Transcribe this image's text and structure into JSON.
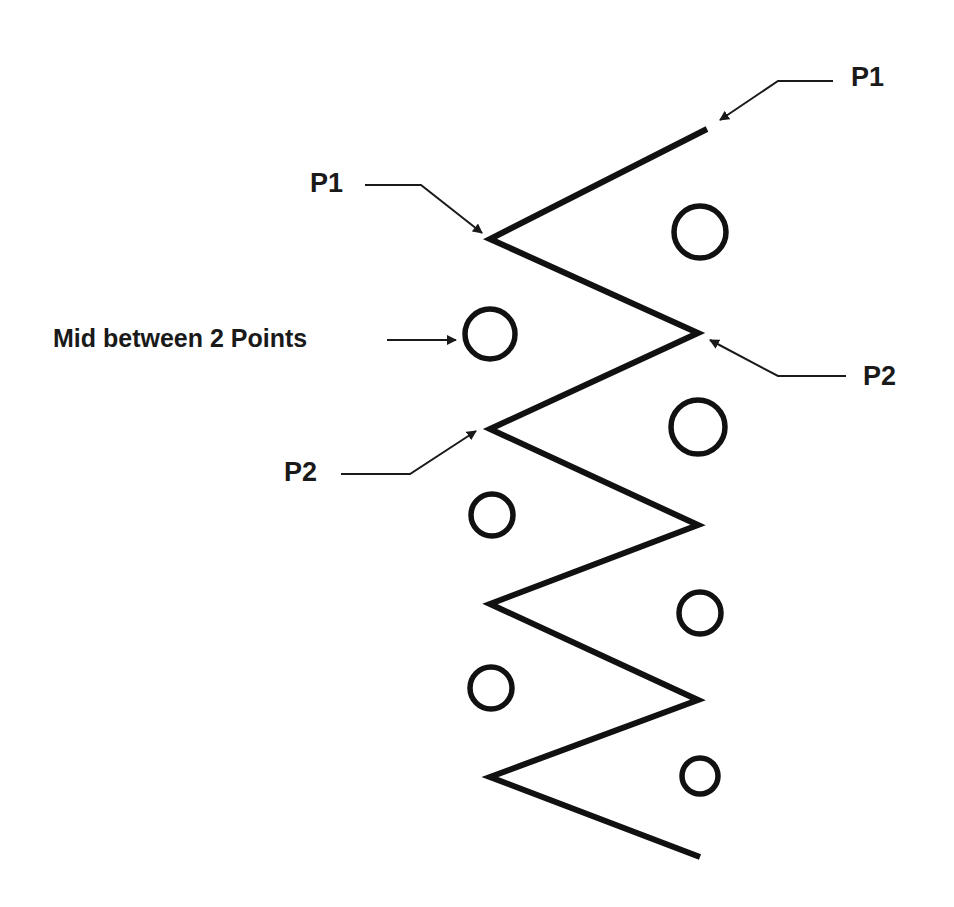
{
  "diagram": {
    "labels": {
      "p1_top_right": "P1",
      "p1_left": "P1",
      "mid": "Mid between 2 Points",
      "p2_right": "P2",
      "p2_left": "P2"
    },
    "zigzag_points": [
      [
        707,
        129
      ],
      [
        490,
        239
      ],
      [
        698,
        333
      ],
      [
        490,
        429
      ],
      [
        698,
        525
      ],
      [
        490,
        604
      ],
      [
        698,
        700
      ],
      [
        490,
        777
      ],
      [
        700,
        857
      ]
    ],
    "circles": [
      {
        "cx": 700,
        "cy": 232,
        "r": 26
      },
      {
        "cx": 490,
        "cy": 334,
        "r": 25
      },
      {
        "cx": 698,
        "cy": 427,
        "r": 27
      },
      {
        "cx": 492,
        "cy": 515,
        "r": 21
      },
      {
        "cx": 700,
        "cy": 613,
        "r": 21
      },
      {
        "cx": 491,
        "cy": 688,
        "r": 21
      },
      {
        "cx": 700,
        "cy": 776,
        "r": 18
      }
    ],
    "colors": {
      "stroke": "#111111",
      "text": "#1a1a1a",
      "background": "#ffffff"
    }
  }
}
